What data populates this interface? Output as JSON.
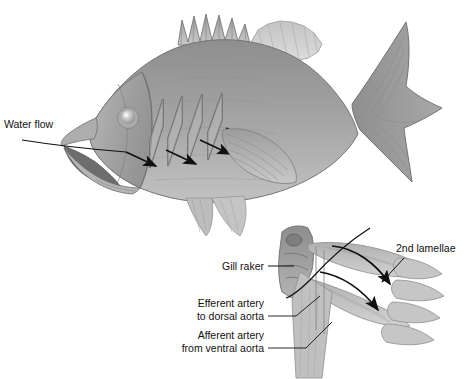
{
  "figure": {
    "title_visible": false,
    "background_color": "#ffffff",
    "ink_color": "#111111",
    "body_gray": "#9a9a9a",
    "fin_gray": "#b5b5b5",
    "light_gray": "#c8c8c8",
    "dark_gray": "#6e6e6e",
    "outline_gray": "#555555"
  },
  "labels": {
    "water_flow": "Water flow",
    "gill_raker": "Gill raker",
    "efferent_line1": "Efferent artery",
    "efferent_line2": "to dorsal aorta",
    "afferent_line1": "Afferent artery",
    "afferent_line2": "from ventral aorta",
    "second_lamellae": "2nd lamellae"
  },
  "diagrams": {
    "upper": {
      "name": "whole-fish-lateral-view",
      "description": "Lateral view of a perch-like fish with mouth open showing gill arches and water flow arrows"
    },
    "lower": {
      "name": "gill-arch-detail",
      "description": "Enlarged single gill arch with filaments and secondary lamellae"
    }
  },
  "arrows": {
    "gill_flow_count": 3,
    "lamellae_flow_count": 2,
    "water_flow_inlet": 1
  }
}
